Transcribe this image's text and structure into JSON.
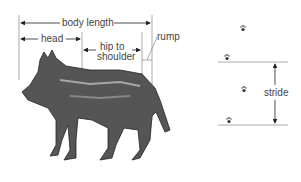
{
  "labels": {
    "body_length": "body length",
    "head": "head",
    "hip_to": "hip to",
    "shoulder": "shoulder",
    "rump": "rump",
    "stride": "stride"
  },
  "figure": {
    "animal": "wolf illustration",
    "track_icon": "paw-print"
  }
}
